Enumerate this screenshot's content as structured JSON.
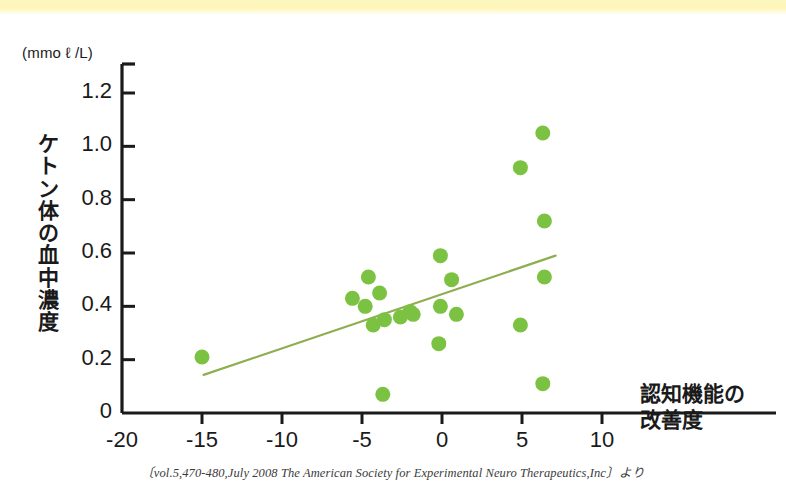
{
  "figure": {
    "unit_label": "(mmo ℓ /L)",
    "y_axis_title_chars": [
      "ケ",
      "ト",
      "ン",
      "体",
      "の",
      "血",
      "中",
      "濃",
      "度"
    ],
    "x_axis_title_lines": [
      "認知機能の",
      "改善度"
    ],
    "citation": "〔vol.5,470-480,July 2008 The American Society for Experimental Neuro Therapeutics,Inc〕より",
    "colors": {
      "point_green": "#7cc242",
      "trend_line": "#8fae52",
      "axis_black": "#1a1a1a",
      "banner_yellow": "#fdf5b8"
    }
  },
  "chart_data": {
    "type": "scatter",
    "title": "",
    "xlabel": "認知機能の改善度",
    "ylabel": "ケトン体の血中濃度 (mmo ℓ /L)",
    "xlim": [
      -20,
      10
    ],
    "ylim": [
      0,
      1.3
    ],
    "xticks": [
      -20,
      -15,
      -10,
      -5,
      0,
      5,
      10
    ],
    "xtick_labels": [
      "-20",
      "-15",
      "-10",
      "-5",
      "0",
      "5",
      "10"
    ],
    "yticks": [
      0,
      0.2,
      0.4,
      0.6,
      0.8,
      1.0,
      1.2
    ],
    "ytick_labels": [
      "0",
      "0.2",
      "0.4",
      "0.6",
      "0.8",
      "1.0",
      "1.2"
    ],
    "grid": false,
    "legend": null,
    "marker": {
      "shape": "circle",
      "size_px": 15,
      "color": "#7cc242"
    },
    "points": [
      {
        "x": -15.0,
        "y": 0.21
      },
      {
        "x": -5.6,
        "y": 0.43
      },
      {
        "x": -4.6,
        "y": 0.51
      },
      {
        "x": -4.8,
        "y": 0.4
      },
      {
        "x": -4.3,
        "y": 0.33
      },
      {
        "x": -3.9,
        "y": 0.45
      },
      {
        "x": -3.6,
        "y": 0.35
      },
      {
        "x": -3.7,
        "y": 0.07
      },
      {
        "x": -2.6,
        "y": 0.36
      },
      {
        "x": -2.0,
        "y": 0.38
      },
      {
        "x": -1.8,
        "y": 0.37
      },
      {
        "x": -0.1,
        "y": 0.59
      },
      {
        "x": -0.1,
        "y": 0.4
      },
      {
        "x": -0.2,
        "y": 0.26
      },
      {
        "x": 0.6,
        "y": 0.5
      },
      {
        "x": 0.9,
        "y": 0.37
      },
      {
        "x": 4.9,
        "y": 0.92
      },
      {
        "x": 4.9,
        "y": 0.33
      },
      {
        "x": 6.3,
        "y": 1.05
      },
      {
        "x": 6.4,
        "y": 0.72
      },
      {
        "x": 6.4,
        "y": 0.51
      },
      {
        "x": 6.3,
        "y": 0.11
      }
    ],
    "trend_line": {
      "x_start": -14.9,
      "y_start": 0.143,
      "x_end": 7.1,
      "y_end": 0.59,
      "color": "#8fae52"
    }
  }
}
